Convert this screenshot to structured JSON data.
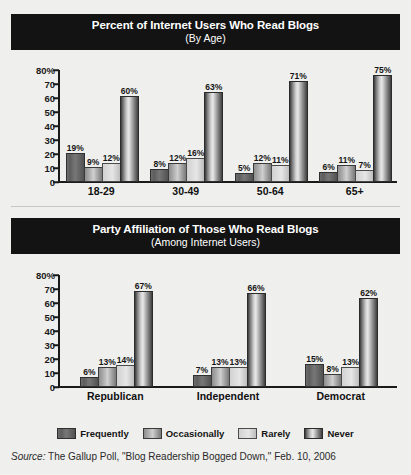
{
  "chart_data": [
    {
      "type": "bar",
      "title": "Percent of Internet Users Who Read Blogs",
      "subtitle": "(By Age)",
      "xlabel": "",
      "ylabel": "",
      "ylim": [
        0,
        80
      ],
      "grid": false,
      "legend_position": "bottom",
      "ytick_labels": [
        "80%",
        "70",
        "60",
        "50",
        "40",
        "30",
        "20",
        "10",
        "0"
      ],
      "ytick_values": [
        80,
        70,
        60,
        50,
        40,
        30,
        20,
        10,
        0
      ],
      "categories": [
        "18-29",
        "30-49",
        "50-64",
        "65+"
      ],
      "series": [
        {
          "name": "Frequently",
          "values": [
            19,
            8,
            5,
            6
          ],
          "labels": [
            "19%",
            "8%",
            "5%",
            "6%"
          ]
        },
        {
          "name": "Occasionally",
          "values": [
            9,
            12,
            12,
            11
          ],
          "labels": [
            "9%",
            "12%",
            "12%",
            "11%"
          ]
        },
        {
          "name": "Rarely",
          "values": [
            12,
            16,
            11,
            7
          ],
          "labels": [
            "12%",
            "16%",
            "11%",
            "7%"
          ]
        },
        {
          "name": "Never",
          "values": [
            60,
            63,
            71,
            75
          ],
          "labels": [
            "60%",
            "63%",
            "71%",
            "75%"
          ]
        }
      ]
    },
    {
      "type": "bar",
      "title": "Party Affiliation of Those Who Read Blogs",
      "subtitle": "(Among Internet Users)",
      "xlabel": "",
      "ylabel": "",
      "ylim": [
        0,
        80
      ],
      "grid": false,
      "legend_position": "bottom",
      "ytick_labels": [
        "80%",
        "70",
        "60",
        "50",
        "40",
        "30",
        "20",
        "10",
        "0"
      ],
      "ytick_values": [
        80,
        70,
        60,
        50,
        40,
        30,
        20,
        10,
        0
      ],
      "categories": [
        "Republican",
        "Independent",
        "Democrat"
      ],
      "series": [
        {
          "name": "Frequently",
          "values": [
            6,
            7,
            15
          ],
          "labels": [
            "6%",
            "7%",
            "15%"
          ]
        },
        {
          "name": "Occasionally",
          "values": [
            13,
            13,
            8
          ],
          "labels": [
            "13%",
            "13%",
            "8%"
          ]
        },
        {
          "name": "Rarely",
          "values": [
            14,
            13,
            13
          ],
          "labels": [
            "14%",
            "13%",
            "13%"
          ]
        },
        {
          "name": "Never",
          "values": [
            67,
            66,
            62
          ],
          "labels": [
            "67%",
            "66%",
            "62%"
          ]
        }
      ]
    }
  ],
  "legend": {
    "items": [
      {
        "label": "Frequently",
        "swatch": "frequently-swatch"
      },
      {
        "label": "Occasionally",
        "swatch": "occasionally-swatch"
      },
      {
        "label": "Rarely",
        "swatch": "rarely-swatch"
      },
      {
        "label": "Never",
        "swatch": "never-swatch"
      }
    ]
  },
  "source": {
    "label": "Source:",
    "text": " The Gallup Poll, \"Blog Readership Bogged Down,\" Feb. 10, 2006"
  },
  "colors": {
    "banner_bg": "#131313",
    "banner_fg": "#ffffff",
    "page_bg": "#efefed",
    "axis": "#1a1a1a",
    "frequently": "#5d5d5d",
    "occasionally": "#a8a8a8",
    "rarely": "#dcdcdc",
    "never": "#8a8a8a"
  }
}
